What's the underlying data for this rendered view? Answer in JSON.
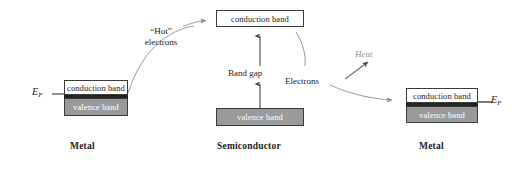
{
  "figure": {
    "type": "energy-band-diagram",
    "background_color": "#ffffff",
    "palette": {
      "outline": "#3a3a3a",
      "valence_fill": "#9a9a9a",
      "conduction_fill": "#ffffff",
      "fermi_line": "#232323",
      "arrow_gray": "#8c8c8c",
      "arrow_dark": "#3a3a3a",
      "text": "#1a1a1a",
      "heat_text": "#8c8c8c"
    }
  },
  "left_metal": {
    "section_label": "Metal",
    "conduction_band_label": "conduction band",
    "valence_band_label": "valence band",
    "fermi_label": "E",
    "fermi_subscript": "F"
  },
  "semiconductor": {
    "section_label": "Semiconductor",
    "conduction_band_label": "conduction band",
    "valence_band_label": "valence band",
    "band_gap_label": "Band gap"
  },
  "right_metal": {
    "section_label": "Metal",
    "conduction_band_label": "conduction band",
    "valence_band_label": "valence band",
    "fermi_label": "E",
    "fermi_subscript": "F"
  },
  "annotations": {
    "hot_electrons_line1": "“Hot”",
    "hot_electrons_line2": "electrons",
    "electrons_label": "Electrons",
    "heat_label": "Heat"
  }
}
